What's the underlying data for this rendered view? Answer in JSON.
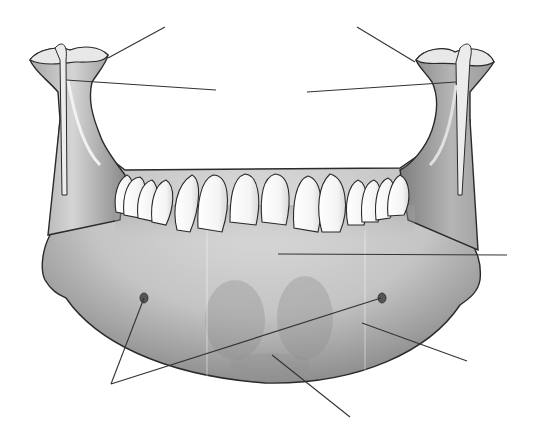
{
  "figure": {
    "subject": "Mandible (lower jaw) — anterior view with unlabeled leader lines",
    "background": "#ffffff",
    "bone_color_light": "#e2e2e2",
    "bone_color_mid": "#b9b9b9",
    "bone_color_dark": "#7d7d7d",
    "outline_color": "#2a2a2a",
    "tooth_color": "#ffffff",
    "leader_color": "#333333"
  },
  "leader_lines": [
    {
      "id": "left-condyle",
      "x1": 165,
      "y1": 27,
      "x2": 108,
      "y2": 58
    },
    {
      "id": "left-coronoid",
      "x1": 216,
      "y1": 90,
      "x2": 66,
      "y2": 80
    },
    {
      "id": "right-condyle",
      "x1": 357,
      "y1": 27,
      "x2": 415,
      "y2": 62
    },
    {
      "id": "right-coronoid",
      "x1": 307,
      "y1": 92,
      "x2": 456,
      "y2": 82
    },
    {
      "id": "body",
      "x1": 278,
      "y1": 254,
      "x2": 507,
      "y2": 255
    },
    {
      "id": "mental-foramen-left",
      "x1": 111,
      "y1": 384,
      "x2": 144,
      "y2": 298
    },
    {
      "id": "mental-foramen-right",
      "x1": 111,
      "y1": 384,
      "x2": 381,
      "y2": 298
    },
    {
      "id": "mental-tubercle",
      "x1": 362,
      "y1": 323,
      "x2": 467,
      "y2": 361
    },
    {
      "id": "mental-protuberance",
      "x1": 272,
      "y1": 355,
      "x2": 350,
      "y2": 417
    }
  ],
  "teeth_count": 16,
  "labels": []
}
